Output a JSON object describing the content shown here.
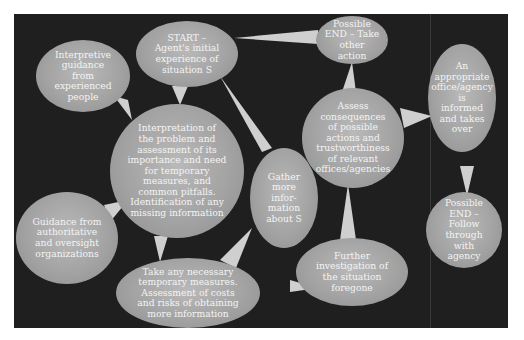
{
  "diagram": {
    "type": "flow-diagram",
    "background_color": "#1f1f1f",
    "bubble_color": "#a6a6a6",
    "text_color": "#f4f4f4",
    "nodes": {
      "start": {
        "label": "START –\nAgent's initial\nexperience of\nsituation S"
      },
      "interpretive_guidance": {
        "label": "Interpretive\nguidance\nfrom\nexperienced\npeople"
      },
      "interpretation": {
        "label": "Interpretation of\nthe problem and\nassessment of its\nimportance and need\nfor temporary\nmeasures, and\ncommon pitfalls.\nIdentification of any\nmissing information"
      },
      "guidance_authoritative": {
        "label": "Guidance from\nauthoritative\nand oversight\norganizations"
      },
      "take_measures": {
        "label": "Take any necessary\ntemporary measures.\nAssessment of costs\nand risks of obtaining\nmore information"
      },
      "gather_info": {
        "label": "Gather\nmore\ninfor-\nmation\nabout S"
      },
      "end_other_action": {
        "label": "Possible\nEND – Take\nother\naction"
      },
      "assess_consequences": {
        "label": "Assess\nconsequences\nof possible\nactions and\ntrustworthiness\nof relevant\noffices/agencies"
      },
      "further_investigation": {
        "label": "Further\ninvestigation of\nthe situation\nforegone"
      },
      "office_informed": {
        "label": "An\nappropriate\noffice/agency\nis\ninformed\nand takes\nover"
      },
      "end_follow_through": {
        "label": "Possible\nEND –\nFollow\nthrough\nwith\nagency"
      }
    },
    "connections": [
      {
        "from": "start",
        "to": "interpretation"
      },
      {
        "from": "interpretive_guidance",
        "to": "interpretation"
      },
      {
        "from": "guidance_authoritative",
        "to": "interpretation"
      },
      {
        "from": "interpretation",
        "to": "take_measures"
      },
      {
        "from": "take_measures",
        "to": "gather_info"
      },
      {
        "from": "gather_info",
        "to": "start"
      },
      {
        "from": "take_measures",
        "to": "further_investigation"
      },
      {
        "from": "further_investigation",
        "to": "assess_consequences"
      },
      {
        "from": "assess_consequences",
        "to": "end_other_action"
      },
      {
        "from": "end_other_action",
        "to": "start"
      },
      {
        "from": "assess_consequences",
        "to": "office_informed"
      },
      {
        "from": "office_informed",
        "to": "end_follow_through"
      }
    ]
  }
}
